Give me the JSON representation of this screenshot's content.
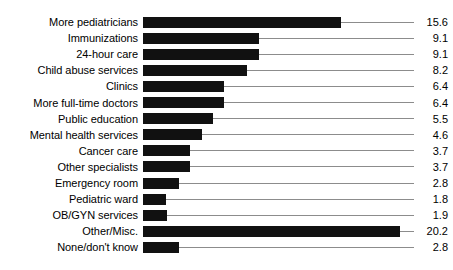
{
  "chart_data": {
    "type": "bar",
    "orientation": "horizontal",
    "title": "",
    "subtitle": "",
    "xlabel": "",
    "ylabel": "",
    "xlim": [
      0,
      20.2
    ],
    "grid": false,
    "legend": null,
    "bar_color": "#111111",
    "leader_line_color": "#8c8c8c",
    "background_color": "#ffffff",
    "value_label_format": "one-decimal",
    "categories": [
      "More pediatricians",
      "Immunizations",
      "24-hour care",
      "Child abuse services",
      "Clinics",
      "More full-time doctors",
      "Public education",
      "Mental health services",
      "Cancer care",
      "Other specialists",
      "Emergency room",
      "Pediatric ward",
      "OB/GYN services",
      "Other/Misc.",
      "None/don't know"
    ],
    "values": [
      15.6,
      9.1,
      9.1,
      8.2,
      6.4,
      6.4,
      5.5,
      4.6,
      3.7,
      3.7,
      2.8,
      1.8,
      1.9,
      20.2,
      2.8
    ],
    "value_labels": [
      "15.6",
      "9.1",
      "9.1",
      "8.2",
      "6.4",
      "6.4",
      "5.5",
      "4.6",
      "3.7",
      "3.7",
      "2.8",
      "1.8",
      "1.9",
      "20.2",
      "2.8"
    ]
  },
  "layout": {
    "plot_origin_x": 143,
    "px_per_unit": 12.72,
    "first_row_top": 14,
    "row_pitch": 16.1,
    "leader_end_x": 414,
    "label_right_edge": 138
  }
}
